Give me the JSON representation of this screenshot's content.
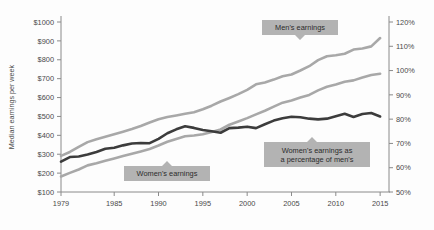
{
  "chart_data": {
    "type": "line",
    "title": "",
    "subtitle": "",
    "xlabel": "",
    "ylabel": "Median earnings per week",
    "y2label": "",
    "grid": false,
    "legend_position": "inline-callouts",
    "x": [
      1979,
      1980,
      1981,
      1982,
      1983,
      1984,
      1985,
      1986,
      1987,
      1988,
      1989,
      1990,
      1991,
      1992,
      1993,
      1994,
      1995,
      1996,
      1997,
      1998,
      1999,
      2000,
      2001,
      2002,
      2003,
      2004,
      2005,
      2006,
      2007,
      2008,
      2009,
      2010,
      2011,
      2012,
      2013,
      2014,
      2015
    ],
    "xtick_labels": [
      "1979",
      "1985",
      "1990",
      "1995",
      "2000",
      "2005",
      "2010",
      "2015"
    ],
    "xticks": [
      1979,
      1985,
      1990,
      1995,
      2000,
      2005,
      2010,
      2015
    ],
    "xlim": [
      1979,
      2016
    ],
    "ylim": [
      100,
      1000
    ],
    "yticks": [
      100,
      200,
      300,
      400,
      500,
      600,
      700,
      800,
      900,
      1000
    ],
    "ytick_labels": [
      "$100",
      "$200",
      "$300",
      "$400",
      "$500",
      "$600",
      "$700",
      "$800",
      "$900",
      "$1000"
    ],
    "y2lim": [
      50,
      120
    ],
    "y2ticks": [
      50,
      60,
      70,
      80,
      90,
      100,
      110,
      120
    ],
    "y2tick_labels": [
      "50%",
      "60%",
      "70%",
      "80%",
      "90%",
      "100%",
      "110%",
      "120%"
    ],
    "series": [
      {
        "name": "Men's earnings",
        "axis": "left",
        "color": "#a8a8a8",
        "values": [
          291,
          312,
          339,
          364,
          379,
          392,
          406,
          419,
          433,
          449,
          468,
          485,
          497,
          505,
          514,
          522,
          538,
          557,
          579,
          598,
          618,
          641,
          670,
          680,
          695,
          713,
          722,
          743,
          766,
          798,
          819,
          824,
          832,
          854,
          860,
          871,
          915
        ]
      },
      {
        "name": "Women's earnings",
        "axis": "left",
        "color": "#a8a8a8",
        "values": [
          182,
          201,
          219,
          241,
          252,
          265,
          277,
          290,
          303,
          315,
          328,
          346,
          366,
          381,
          395,
          399,
          406,
          418,
          431,
          456,
          473,
          491,
          511,
          530,
          552,
          573,
          585,
          600,
          614,
          638,
          657,
          669,
          684,
          691,
          706,
          719,
          726
        ]
      },
      {
        "name": "Women's earnings as a percentage of men's",
        "axis": "right",
        "color": "#3c3c3c",
        "values": [
          62.5,
          64.4,
          64.6,
          65.4,
          66.5,
          67.8,
          68.2,
          69.2,
          70.0,
          70.2,
          70.1,
          71.9,
          74.2,
          75.8,
          77.1,
          76.4,
          75.5,
          75.0,
          74.4,
          76.3,
          76.5,
          76.9,
          76.3,
          77.9,
          79.4,
          80.4,
          81.0,
          80.8,
          80.2,
          79.9,
          80.2,
          81.2,
          82.2,
          80.9,
          82.1,
          82.5,
          81.1
        ]
      }
    ],
    "annotations": [
      {
        "id": "mens-earnings",
        "text_lines": [
          "Men's earnings"
        ],
        "pointer": "down",
        "box_x": 262,
        "box_y": 20,
        "box_w": 76,
        "box_h": 15,
        "pointer_x": 300
      },
      {
        "id": "womens-earnings",
        "text_lines": [
          "Women's earnings"
        ],
        "pointer": "up",
        "box_x": 124,
        "box_y": 166,
        "box_w": 86,
        "box_h": 15,
        "pointer_x": 167
      },
      {
        "id": "womens-percentage",
        "text_lines": [
          "Women's earnings as",
          "a percentage of men's"
        ],
        "pointer": "up",
        "box_x": 264,
        "box_y": 142,
        "box_w": 106,
        "box_h": 25,
        "pointer_x": 312
      }
    ],
    "colors": {
      "background": "#fdfdfd",
      "axis": "#8a8a8a",
      "tick_text": "#4a4a4a",
      "callout_fill": "#b3b3b3",
      "light_series": "#a8a8a8",
      "dark_series": "#3c3c3c"
    }
  }
}
